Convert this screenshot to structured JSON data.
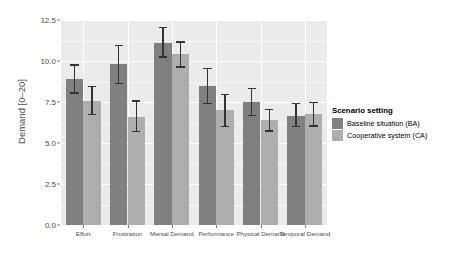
{
  "chart_data": {
    "type": "bar",
    "title": "",
    "xlabel": "",
    "ylabel": "Demand [0–20]",
    "ylim": [
      0,
      12.5
    ],
    "y_ticks": [
      "0.0",
      "2.5",
      "5.0",
      "7.5",
      "10.0",
      "12.5"
    ],
    "y_tick_values": [
      0,
      2.5,
      5,
      7.5,
      10,
      12.5
    ],
    "grid": "horizontal-and-vertical-white-on-gray",
    "legend_position": "right",
    "categories": [
      "Effort",
      "Frustration",
      "Mental Demand",
      "Performance",
      "Physical Demand",
      "Temporal Demand"
    ],
    "series": [
      {
        "name": "Baseline situation (BA)",
        "color": "#808080",
        "values": [
          8.9,
          9.8,
          11.1,
          8.45,
          7.5,
          6.65
        ],
        "error_low": [
          8.0,
          8.6,
          10.2,
          7.35,
          6.65,
          5.95
        ],
        "error_high": [
          9.8,
          11.0,
          12.1,
          9.6,
          8.35,
          7.45
        ]
      },
      {
        "name": "Cooperative system (CA)",
        "color": "#aeaeae",
        "values": [
          7.55,
          6.6,
          10.4,
          7.0,
          6.4,
          6.75
        ],
        "error_low": [
          6.7,
          5.65,
          9.6,
          5.95,
          5.7,
          6.0
        ],
        "error_high": [
          8.5,
          7.6,
          11.2,
          8.0,
          7.1,
          7.5
        ]
      }
    ]
  },
  "legend": {
    "title": "Scenario setting",
    "items": [
      {
        "label": "Baseline situation (BA)",
        "color": "#808080"
      },
      {
        "label": "Cooperative system (CA)",
        "color": "#aeaeae"
      }
    ]
  },
  "axes": {
    "y_title": "Demand [0–20]"
  }
}
